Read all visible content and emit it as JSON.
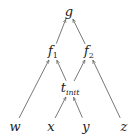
{
  "diagram": {
    "type": "dag",
    "direction": "bottom-to-top",
    "colors": {
      "edge": "#555555",
      "text": "#222222",
      "background": "#ffffff"
    },
    "nodes": [
      {
        "id": "g",
        "label": "g",
        "sub": "",
        "x": 69,
        "y": 11
      },
      {
        "id": "f1",
        "label": "f",
        "sub": "1",
        "x": 53,
        "y": 52
      },
      {
        "id": "f2",
        "label": "f",
        "sub": "2",
        "x": 89,
        "y": 52
      },
      {
        "id": "tinit",
        "label": "t",
        "sub": "init",
        "x": 70,
        "y": 89
      },
      {
        "id": "w",
        "label": "w",
        "sub": "",
        "x": 15,
        "y": 126
      },
      {
        "id": "x",
        "label": "x",
        "sub": "",
        "x": 51,
        "y": 126
      },
      {
        "id": "y",
        "label": "y",
        "sub": "",
        "x": 86,
        "y": 126
      },
      {
        "id": "z",
        "label": "z",
        "sub": "",
        "x": 124,
        "y": 126
      }
    ],
    "edges": [
      {
        "from": "f1",
        "to": "g"
      },
      {
        "from": "f2",
        "to": "g"
      },
      {
        "from": "w",
        "to": "f1"
      },
      {
        "from": "tinit",
        "to": "f1"
      },
      {
        "from": "tinit",
        "to": "f2"
      },
      {
        "from": "z",
        "to": "f2"
      },
      {
        "from": "x",
        "to": "tinit"
      },
      {
        "from": "y",
        "to": "tinit"
      }
    ]
  }
}
